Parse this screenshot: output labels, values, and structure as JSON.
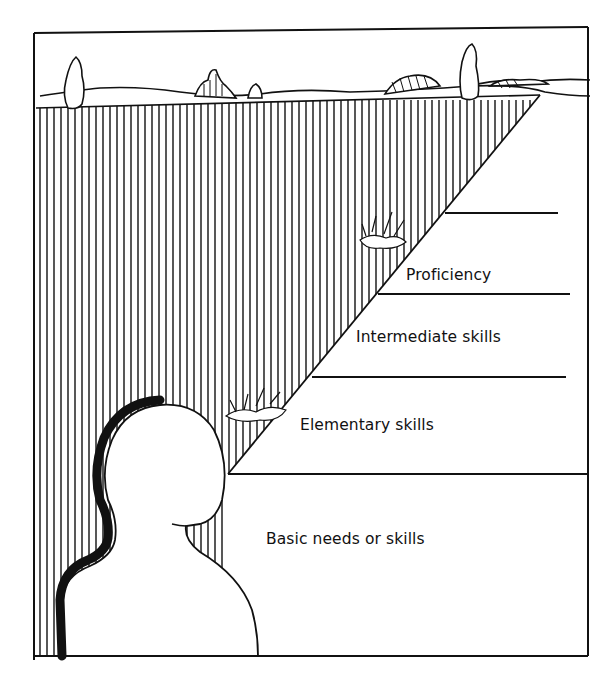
{
  "figure": {
    "levels": [
      {
        "label": "Proficiency"
      },
      {
        "label": "Intermediate skills"
      },
      {
        "label": "Elementary skills"
      },
      {
        "label": "Basic needs or skills"
      }
    ],
    "colors": {
      "ink": "#111111",
      "paper": "#ffffff"
    }
  }
}
